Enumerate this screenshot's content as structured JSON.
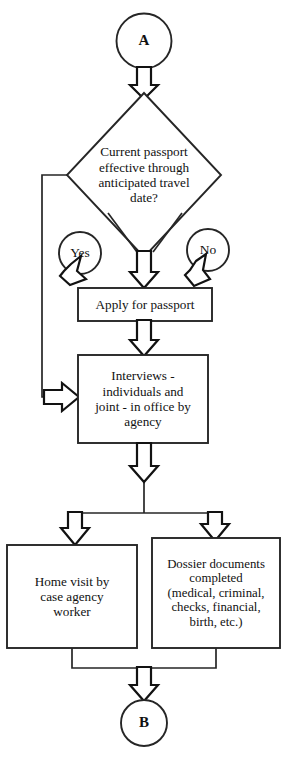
{
  "diagram": {
    "type": "flowchart",
    "line_color": "#262626",
    "text_color": "#111111",
    "background": "#ffffff"
  },
  "nodes": {
    "start_terminal": {
      "label": "A",
      "shape": "circle"
    },
    "decision": {
      "label": "Current passport\neffective through\nanticipated travel\ndate?",
      "shape": "diamond"
    },
    "branch_yes": {
      "label": "Yes",
      "shape": "circle"
    },
    "branch_no": {
      "label": "No",
      "shape": "circle"
    },
    "apply_passport": {
      "label": "Apply for passport",
      "shape": "rectangle"
    },
    "interviews": {
      "label": "Interviews -\nindividuals and\njoint - in office by\nagency",
      "shape": "rectangle"
    },
    "home_visit": {
      "label": "Home visit by\ncase agency\nworker",
      "shape": "rectangle"
    },
    "dossier": {
      "label": "Dossier documents\ncompleted\n(medical, criminal,\nchecks, financial,\nbirth, etc.)",
      "shape": "rectangle"
    },
    "end_terminal": {
      "label": "B",
      "shape": "circle"
    }
  },
  "connectors": [
    {
      "name": "a-to-decision",
      "from": "start_terminal",
      "to": "decision",
      "arrow": "down"
    },
    {
      "name": "decision-no-to-apply",
      "from": "decision",
      "to": "apply_passport",
      "arrow": "down-left",
      "branch_label": "No"
    },
    {
      "name": "decision-center-to-apply",
      "from": "decision",
      "to": "apply_passport",
      "arrow": "down"
    },
    {
      "name": "decision-yes-loop",
      "from": "decision",
      "to": "interviews",
      "arrow": "right",
      "branch_label": "Yes"
    },
    {
      "name": "apply-to-interviews",
      "from": "apply_passport",
      "to": "interviews",
      "arrow": "down"
    },
    {
      "name": "interviews-to-home-visit",
      "from": "interviews",
      "to": "home_visit",
      "arrow": "down"
    },
    {
      "name": "interviews-to-dossier",
      "from": "interviews",
      "to": "dossier",
      "arrow": "down"
    },
    {
      "name": "merge-to-b",
      "from": "home_visit,dossier",
      "to": "end_terminal",
      "arrow": "down"
    }
  ]
}
